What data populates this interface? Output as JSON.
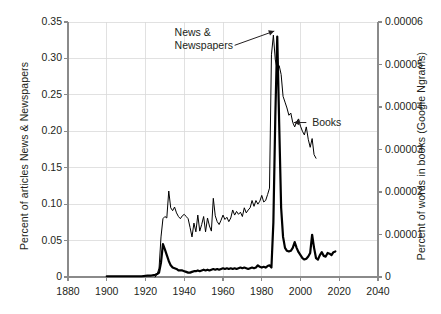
{
  "chart_data": {
    "type": "line",
    "title": "",
    "xlabel": "",
    "ylabel": "Percent of articles News & Newspapers",
    "ylabel_right": "Percent of words in books (Google Ngrams)",
    "xlim": [
      1880,
      2040
    ],
    "ylim": [
      0,
      0.35
    ],
    "ylim_right": [
      0,
      6e-05
    ],
    "grid": true,
    "legend_position": "none",
    "xticks": [
      "1880",
      "1900",
      "1920",
      "1940",
      "1960",
      "1980",
      "2000",
      "2020",
      "2040"
    ],
    "xtick_values": [
      1880,
      1900,
      1920,
      1940,
      1960,
      1980,
      2000,
      2020,
      2040
    ],
    "yticks_left": [
      "0",
      "0.05",
      "0.10",
      "0.15",
      "0.20",
      "0.25",
      "0.30",
      "0.35"
    ],
    "ytick_values_left": [
      0,
      0.05,
      0.1,
      0.15,
      0.2,
      0.25,
      0.3,
      0.35
    ],
    "yticks_right": [
      "0",
      "0.00001",
      "0.00002",
      "0.00003",
      "0.00004",
      "0.00005",
      "0.00006"
    ],
    "ytick_values_right": [
      0,
      1e-05,
      2e-05,
      3e-05,
      4e-05,
      5e-05,
      6e-05
    ],
    "annotations": [
      {
        "name": "news-newspapers",
        "text_line1": "News &",
        "text_line2": "Newspapers",
        "x": 1952,
        "y": 0.325,
        "points_to_x": 1988,
        "points_to_y": 0.332
      },
      {
        "name": "books",
        "text": "Books",
        "x": 2002,
        "y": 0.215,
        "points_to_x": 1996,
        "points_to_y": 0.212
      }
    ],
    "series": [
      {
        "name": "News & Newspapers",
        "axis": "left",
        "style": "thick",
        "x": [
          1900,
          1903,
          1906,
          1909,
          1912,
          1915,
          1918,
          1921,
          1923,
          1925,
          1926,
          1927,
          1928,
          1929,
          1930,
          1931,
          1932,
          1933,
          1934,
          1935,
          1936,
          1937,
          1938,
          1939,
          1940,
          1941,
          1942,
          1943,
          1944,
          1945,
          1946,
          1947,
          1948,
          1949,
          1950,
          1951,
          1952,
          1953,
          1954,
          1955,
          1956,
          1957,
          1958,
          1959,
          1960,
          1961,
          1962,
          1963,
          1964,
          1965,
          1966,
          1967,
          1968,
          1969,
          1970,
          1971,
          1972,
          1973,
          1974,
          1975,
          1976,
          1977,
          1978,
          1979,
          1980,
          1981,
          1982,
          1983,
          1984,
          1985,
          1986,
          1987,
          1988,
          1989,
          1990,
          1991,
          1992,
          1993,
          1994,
          1995,
          1996,
          1997,
          1998,
          1999,
          2000,
          2001,
          2002,
          2003,
          2004,
          2005,
          2006,
          2007,
          2008,
          2009,
          2010,
          2011,
          2012,
          2013,
          2014,
          2015,
          2016,
          2017,
          2018
        ],
        "y": [
          0.001,
          0.001,
          0.001,
          0.001,
          0.001,
          0.001,
          0.001,
          0.002,
          0.002,
          0.003,
          0.004,
          0.006,
          0.02,
          0.045,
          0.038,
          0.03,
          0.022,
          0.016,
          0.013,
          0.012,
          0.011,
          0.009,
          0.009,
          0.009,
          0.008,
          0.007,
          0.006,
          0.006,
          0.007,
          0.008,
          0.008,
          0.009,
          0.008,
          0.009,
          0.01,
          0.009,
          0.01,
          0.009,
          0.01,
          0.011,
          0.01,
          0.011,
          0.01,
          0.011,
          0.012,
          0.011,
          0.012,
          0.011,
          0.012,
          0.011,
          0.012,
          0.011,
          0.012,
          0.013,
          0.012,
          0.013,
          0.012,
          0.011,
          0.012,
          0.013,
          0.012,
          0.013,
          0.016,
          0.014,
          0.013,
          0.014,
          0.013,
          0.015,
          0.016,
          0.013,
          0.075,
          0.22,
          0.33,
          0.21,
          0.095,
          0.055,
          0.04,
          0.036,
          0.035,
          0.036,
          0.04,
          0.048,
          0.04,
          0.034,
          0.03,
          0.026,
          0.024,
          0.025,
          0.028,
          0.033,
          0.058,
          0.04,
          0.026,
          0.024,
          0.03,
          0.034,
          0.029,
          0.028,
          0.033,
          0.032,
          0.03,
          0.034,
          0.035
        ]
      },
      {
        "name": "Books",
        "axis": "right",
        "style": "thin",
        "x": [
          1925,
          1926,
          1927,
          1928,
          1929,
          1930,
          1931,
          1932,
          1933,
          1934,
          1935,
          1936,
          1937,
          1938,
          1939,
          1940,
          1941,
          1942,
          1943,
          1944,
          1945,
          1946,
          1947,
          1948,
          1949,
          1950,
          1951,
          1952,
          1953,
          1954,
          1955,
          1956,
          1957,
          1958,
          1959,
          1960,
          1961,
          1962,
          1963,
          1964,
          1965,
          1966,
          1967,
          1968,
          1969,
          1970,
          1971,
          1972,
          1973,
          1974,
          1975,
          1976,
          1977,
          1978,
          1979,
          1980,
          1981,
          1982,
          1983,
          1984,
          1985,
          1986,
          1987,
          1988,
          1989,
          1990,
          1991,
          1992,
          1993,
          1994,
          1995,
          1996,
          1997,
          1998,
          1999,
          2000,
          2001,
          2002,
          2003,
          2004,
          2005,
          2006,
          2007,
          2008
        ],
        "y_left_equiv": [
          0.0,
          0.004,
          0.012,
          0.055,
          0.08,
          0.083,
          0.081,
          0.118,
          0.095,
          0.091,
          0.096,
          0.088,
          0.083,
          0.08,
          0.084,
          0.086,
          0.083,
          0.08,
          0.068,
          0.055,
          0.074,
          0.062,
          0.085,
          0.063,
          0.072,
          0.083,
          0.062,
          0.081,
          0.07,
          0.063,
          0.108,
          0.084,
          0.076,
          0.072,
          0.078,
          0.085,
          0.079,
          0.082,
          0.076,
          0.081,
          0.092,
          0.085,
          0.09,
          0.086,
          0.089,
          0.083,
          0.095,
          0.088,
          0.092,
          0.095,
          0.105,
          0.097,
          0.105,
          0.1,
          0.104,
          0.112,
          0.103,
          0.105,
          0.113,
          0.122,
          0.305,
          0.332,
          0.298,
          0.285,
          0.29,
          0.278,
          0.248,
          0.24,
          0.232,
          0.222,
          0.225,
          0.212,
          0.206,
          0.213,
          0.217,
          0.207,
          0.2,
          0.195,
          0.206,
          0.189,
          0.178,
          0.19,
          0.168,
          0.163
        ]
      }
    ]
  }
}
